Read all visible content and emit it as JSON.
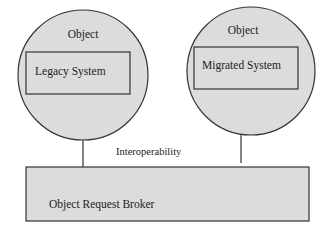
{
  "diagram": {
    "objects": [
      {
        "title": "Object",
        "system": "Legacy System"
      },
      {
        "title": "Object",
        "system": "Migrated System"
      }
    ],
    "connection_label": "Interoperability",
    "broker_label": "Object Request Broker"
  },
  "colors": {
    "fill": "#dcdcdc",
    "stroke": "#333333",
    "background": "#ffffff",
    "text": "#222222"
  }
}
